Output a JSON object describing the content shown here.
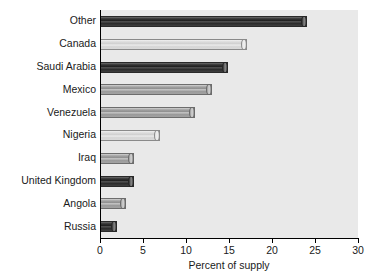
{
  "chart_data": {
    "type": "bar",
    "orientation": "horizontal",
    "title": "",
    "subtitle": "",
    "xlabel": "Percent of supply",
    "ylabel": "",
    "xlim": [
      0,
      30
    ],
    "ylim": null,
    "grid": false,
    "legend": null,
    "legend_position": "none",
    "xticks": [
      0,
      5,
      10,
      15,
      20,
      25,
      30
    ],
    "xtick_labels": [
      "0",
      "5",
      "10",
      "15",
      "20",
      "25",
      "30"
    ],
    "categories": [
      "Other",
      "Canada",
      "Saudi Arabia",
      "Mexico",
      "Venezuela",
      "Nigeria",
      "Iraq",
      "United Kingdom",
      "Angola",
      "Russia"
    ],
    "values": [
      24.1,
      17.1,
      14.9,
      13.0,
      11.0,
      7.0,
      3.9,
      3.9,
      3.0,
      2.0
    ],
    "bar_shades": [
      "dark",
      "light",
      "dark",
      "mid",
      "mid",
      "light",
      "mid",
      "dark",
      "mid",
      "dark"
    ],
    "annotations": []
  },
  "axis": {
    "x_title": "Percent of supply"
  },
  "colors": {
    "plot_background": "#e9e9e9",
    "page_background": "#ffffff",
    "axis": "#000000",
    "text": "#1a1a1a",
    "bar_dark": "#1f1f1f",
    "bar_mid": "#9a9a9a",
    "bar_light": "#d9d9d9"
  }
}
